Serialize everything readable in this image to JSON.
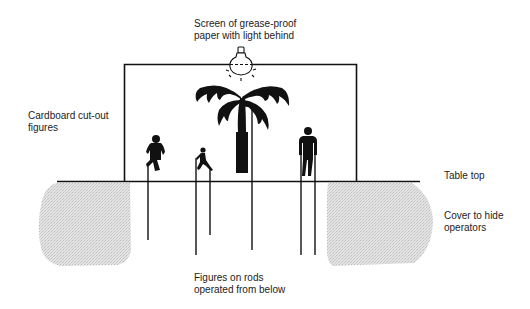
{
  "diagram": {
    "type": "shadow-puppet-theatre-setup",
    "labels": {
      "screen": {
        "line1": "Screen of grease-proof",
        "line2": "paper with light behind"
      },
      "cutouts": {
        "line1": "Cardboard cut-out",
        "line2": "figures"
      },
      "table_top": {
        "line1": "Table top"
      },
      "cover": {
        "line1": "Cover to hide",
        "line2": "operators"
      },
      "rods": {
        "line1": "Figures on rods",
        "line2": "operated from below"
      }
    },
    "elements": [
      {
        "name": "screen-frame",
        "shape": "rectangle-outline"
      },
      {
        "name": "light-bulb-icon",
        "shape": "bulb-with-rays"
      },
      {
        "name": "palm-tree",
        "shape": "silhouette",
        "rods": 1
      },
      {
        "name": "running-figure",
        "shape": "silhouette",
        "rods": 1
      },
      {
        "name": "small-running-figure",
        "shape": "silhouette",
        "rods": 2
      },
      {
        "name": "standing-figure",
        "shape": "silhouette",
        "rods": 2
      },
      {
        "name": "table-top-line",
        "shape": "line"
      },
      {
        "name": "left-cover",
        "shape": "stippled-area"
      },
      {
        "name": "right-cover",
        "shape": "stippled-area"
      }
    ],
    "colors": {
      "ink": "#111111",
      "cover_fill": "#d9d9d9",
      "background": "#ffffff"
    }
  }
}
